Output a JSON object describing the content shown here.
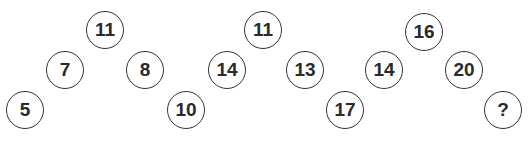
{
  "puzzle": {
    "groups": [
      {
        "nodes": [
          {
            "label": "11",
            "x": 105,
            "y": 30
          },
          {
            "label": "7",
            "x": 65,
            "y": 70
          },
          {
            "label": "8",
            "x": 145,
            "y": 70
          },
          {
            "label": "5",
            "x": 25,
            "y": 110
          },
          {
            "label": "10",
            "x": 186,
            "y": 110
          }
        ]
      },
      {
        "nodes": [
          {
            "label": "11",
            "x": 263,
            "y": 30
          },
          {
            "label": "14",
            "x": 227,
            "y": 70
          },
          {
            "label": "13",
            "x": 305,
            "y": 70
          },
          {
            "label": "17",
            "x": 345,
            "y": 110
          }
        ]
      },
      {
        "nodes": [
          {
            "label": "16",
            "x": 424,
            "y": 32
          },
          {
            "label": "14",
            "x": 384,
            "y": 70
          },
          {
            "label": "20",
            "x": 464,
            "y": 70
          },
          {
            "label": "?",
            "x": 503,
            "y": 110
          }
        ]
      }
    ]
  }
}
